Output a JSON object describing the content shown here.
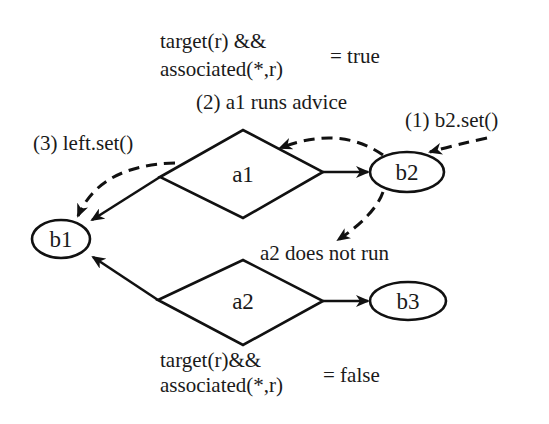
{
  "diagram": {
    "nodes": {
      "b1": {
        "label": "b1",
        "shape": "ellipse"
      },
      "b2": {
        "label": "b2",
        "shape": "ellipse"
      },
      "b3": {
        "label": "b3",
        "shape": "ellipse"
      },
      "a1": {
        "label": "a1",
        "shape": "diamond"
      },
      "a2": {
        "label": "a2",
        "shape": "diamond"
      }
    },
    "edges": [
      {
        "from": "a1",
        "to": "b1",
        "style": "solid"
      },
      {
        "from": "a1",
        "to": "b2",
        "style": "solid"
      },
      {
        "from": "a2",
        "to": "b1",
        "style": "solid"
      },
      {
        "from": "a2",
        "to": "b3",
        "style": "solid"
      }
    ],
    "flow": [
      {
        "step": "(1) b2.set()",
        "style": "dashed",
        "target": "b2"
      },
      {
        "step": "(2) a1 runs advice",
        "style": "dashed",
        "from": "b2",
        "target": "a1"
      },
      {
        "step": "(3) left.set()",
        "style": "dashed",
        "from": "a1",
        "target": "b1"
      },
      {
        "step": "a2 does not run",
        "style": "dashed",
        "from": "b2"
      }
    ],
    "annotations": {
      "top_condition_line1": "target(r) &&",
      "top_condition_line2": "associated(*,r)",
      "top_result": "= true",
      "step2": "(2) a1 runs advice",
      "step1": "(1) b2.set()",
      "step3": "(3) left.set()",
      "a2_note": "a2 does not run",
      "bottom_condition_line1": "target(r)&&",
      "bottom_condition_line2": "associated(*,r)",
      "bottom_result": "= false"
    }
  }
}
